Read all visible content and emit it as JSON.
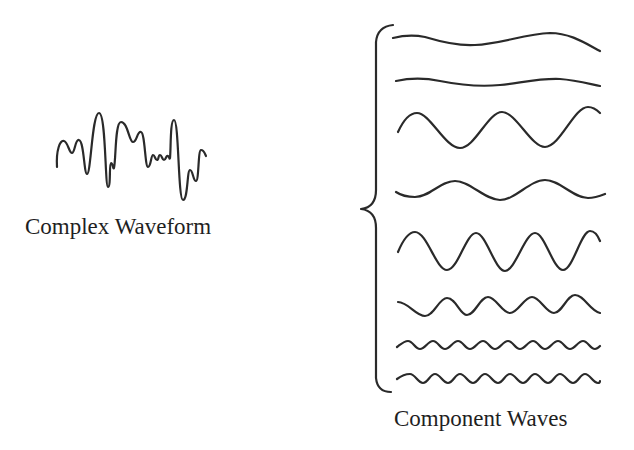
{
  "diagram": {
    "left_label": "Complex Waveform",
    "right_label": "Component Waves",
    "stroke_color": "#2a2a2a",
    "background": "#ffffff"
  },
  "complex_waveform": {
    "name": "complex-waveform",
    "bbox": {
      "x0": 57,
      "y0": 113,
      "x1": 206,
      "y1": 200
    },
    "path": "M57,167 C56,150 60,140 64,141 C68,142 69,153 72,153 C75,153 75,139 79,140 C84,141 84,174 87,174 C91,174 92,113 99,113 C106,113 105,187 108,187 C111,187 109,163 111,163 C113,163 113,170 114,168 C116,160 115,122 121,122 C128,122 129,142 133,142 C137,142 137,131 141,132 C145,133 145,167 148,167 C151,167 151,155 153,155 C155,155 155,160 157,160 C159,160 158,155 160,155 C162,155 162,160 164,160 C166,160 166,155 168,156 C170,157 169,160 170,158 C171,150 170,120 174,120 C179,120 178,200 183,200 C188,200 187,170 190,170 C193,170 193,181 196,181 C199,181 198,150 201,150 C204,150 205,154 206,156"
  },
  "brace": {
    "name": "curly-brace",
    "path": "M393,25 C383,26 377,31 376,42 L376,190 C376,202 370,208 361,209 C370,210 376,216 376,228 L376,378 C377,388 383,392 391,392"
  },
  "component_waves": [
    {
      "index": 1,
      "x_start": 393,
      "x_end": 600,
      "y_center": 42,
      "amplitude": 7,
      "period": 260,
      "phase_deg": 160,
      "path": "M393,38 C405,35 415,35 425,37 C445,43 460,46 475,45 C500,44 525,34 550,33 C570,33 585,43 600,51"
    },
    {
      "index": 2,
      "x_start": 396,
      "x_end": 600,
      "y_center": 82,
      "amplitude": 3,
      "period": 170,
      "phase_deg": 0,
      "path": "M396,81 C410,78 425,78 440,81 C460,85 480,87 500,85 C520,83 540,78 560,79 C575,80 590,84 600,86"
    },
    {
      "index": 3,
      "x_start": 398,
      "x_end": 600,
      "y_center": 129,
      "amplitude": 18,
      "period": 85,
      "phase_deg": 0,
      "path": "M398,132 C403,121 409,113 417,113 C430,113 445,148 460,148 C475,148 488,112 502,112 C516,112 531,147 545,147 C560,147 574,107 588,107 C593,107 597,110 600,113"
    },
    {
      "index": 4,
      "x_start": 396,
      "x_end": 605,
      "y_center": 190,
      "amplitude": 9,
      "period": 90,
      "phase_deg": 0,
      "path": "M396,192 C402,196 408,197 415,197 C430,197 440,181 455,181 C470,181 485,200 500,200 C515,200 530,180 545,180 C560,180 573,198 588,198 C595,198 600,196 605,194"
    },
    {
      "index": 5,
      "x_start": 398,
      "x_end": 600,
      "y_center": 251,
      "amplitude": 19,
      "period": 59,
      "phase_deg": 0,
      "path": "M398,252 C403,240 408,232 415,232 C427,232 436,270 447,270 C458,270 466,233 476,233 C486,233 495,271 505,271 C515,271 525,233 535,233 C545,233 553,270 563,270 C573,270 581,231 590,231 C595,231 598,236 600,241"
    },
    {
      "index": 6,
      "x_start": 398,
      "x_end": 600,
      "y_center": 306,
      "amplitude": 9,
      "period": 42,
      "phase_deg": 0,
      "path": "M398,302 C408,302 416,316 425,316 C434,316 439,298 447,298 C456,298 460,315 467,315 C475,315 480,297 488,297 C496,297 502,313 510,313 C518,313 524,297 532,297 C540,297 546,313 554,313 C562,313 567,295 575,295 C584,295 590,311 600,313"
    },
    {
      "index": 7,
      "x_start": 397,
      "x_end": 600,
      "y_center": 345,
      "amplitude": 4,
      "period": 25,
      "phase_deg": 0,
      "path": "M397,347 C401,344 404,341 408,341 C413,341 415,349 420,349 C425,349 428,341 433,341 C438,341 440,349 445,349 C450,349 453,341 458,341 C463,341 465,349 470,349 C475,349 478,341 483,341 C488,341 490,349 495,349 C500,349 503,341 508,341 C513,341 515,349 520,349 C525,349 528,341 533,341 C538,341 540,349 545,349 C550,349 553,341 558,341 C563,341 565,349 570,349 C575,349 578,341 583,341 C588,341 590,349 595,349 C597,349 599,347 600,346"
    },
    {
      "index": 8,
      "x_start": 397,
      "x_end": 600,
      "y_center": 379,
      "amplitude": 4,
      "period": 25,
      "phase_deg": 0,
      "path": "M397,379 C401,376 405,374 410,374 C415,374 418,383 423,383 C428,383 430,374 435,374 C440,374 443,383 448,383 C453,383 455,374 460,374 C465,374 468,383 473,383 C478,383 480,374 485,374 C490,374 493,383 498,383 C503,383 505,374 510,374 C515,374 518,383 523,383 C528,383 530,374 535,374 C540,374 543,383 548,383 C553,383 555,374 560,374 C565,374 568,383 573,383 C578,383 580,374 585,374 C590,374 593,383 598,383 C599,383 600,382 600,381"
    }
  ]
}
